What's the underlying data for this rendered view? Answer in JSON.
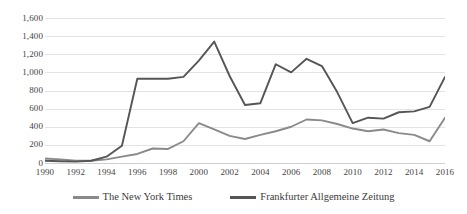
{
  "chart_data": {
    "type": "line",
    "title": "",
    "xlabel": "",
    "ylabel": "",
    "x": [
      1990,
      1991,
      1992,
      1993,
      1994,
      1995,
      1996,
      1997,
      1998,
      1999,
      2000,
      2001,
      2002,
      2003,
      2004,
      2005,
      2006,
      2007,
      2008,
      2009,
      2010,
      2011,
      2012,
      2013,
      2014,
      2015,
      2016
    ],
    "xlim": [
      1990,
      2016
    ],
    "ylim": [
      0,
      1600
    ],
    "ytick_values": [
      0,
      200,
      400,
      600,
      800,
      1000,
      1200,
      1400,
      1600
    ],
    "ytick_labels": [
      "0",
      "200",
      "400",
      "600",
      "800",
      "1,000",
      "1,200",
      "1,400",
      "1,600"
    ],
    "xtick_values": [
      1990,
      1992,
      1994,
      1996,
      1998,
      2000,
      2002,
      2004,
      2006,
      2008,
      2010,
      2012,
      2014,
      2016
    ],
    "xtick_labels": [
      "1990",
      "1992",
      "1994",
      "1996",
      "1998",
      "2000",
      "2002",
      "2004",
      "2006",
      "2008",
      "2010",
      "2012",
      "2014",
      "2016"
    ],
    "grid": true,
    "legend_position": "bottom",
    "series": [
      {
        "name": "The New York Times",
        "color": "#8a8a8a",
        "values": [
          50,
          40,
          25,
          25,
          40,
          70,
          100,
          160,
          155,
          240,
          440,
          370,
          300,
          265,
          310,
          350,
          400,
          480,
          470,
          430,
          380,
          350,
          370,
          330,
          310,
          240,
          500
        ]
      },
      {
        "name": "Frankfurter Allgemeine Zeitung",
        "color": "#555555",
        "values": [
          25,
          20,
          15,
          25,
          70,
          190,
          930,
          930,
          930,
          950,
          1130,
          1340,
          960,
          640,
          660,
          1090,
          1000,
          1150,
          1070,
          780,
          440,
          500,
          490,
          560,
          570,
          620,
          950
        ]
      }
    ]
  },
  "legend": {
    "items": [
      {
        "label": "The New York Times",
        "color": "#8a8a8a",
        "icon": "line-swatch"
      },
      {
        "label": "Frankfurter Allgemeine Zeitung",
        "color": "#555555",
        "icon": "line-swatch"
      }
    ]
  }
}
